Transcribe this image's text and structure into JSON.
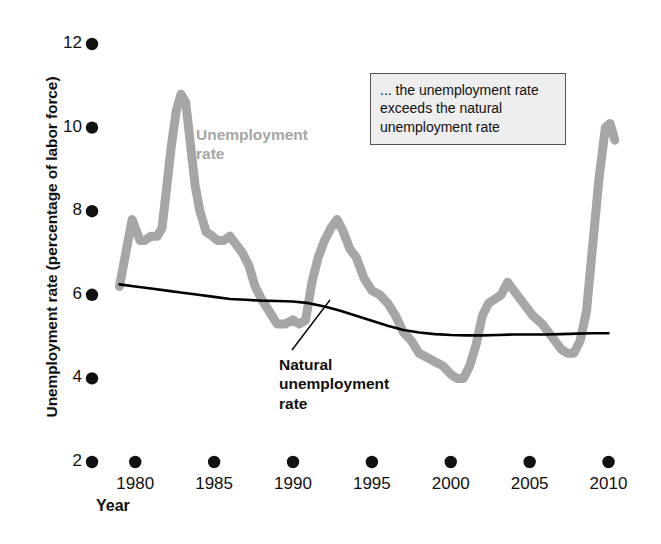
{
  "figure": {
    "background": "#ffffff",
    "series_gray_color": "#a6a6a6",
    "series_black_color": "#000000",
    "tick_dot_color": "#111111"
  },
  "axes": {
    "ylabel": "Unemployment rate (percentage of labor force)",
    "xlabel": "Year",
    "yticks": [
      2,
      4,
      6,
      8,
      10,
      12
    ],
    "ytick_labels": [
      "2",
      "4",
      "6",
      "8",
      "10",
      "12"
    ],
    "xticks": [
      1980,
      1985,
      1990,
      1995,
      2000,
      2005,
      2010
    ],
    "xtick_labels": [
      "1980",
      "1985",
      "1990",
      "1995",
      "2000",
      "2005",
      "2010"
    ],
    "ylim": [
      2,
      12
    ],
    "xlim": [
      1978.4,
      2010.6
    ],
    "grid": false
  },
  "annotations": {
    "callout": "... the unemployment rate exceeds the natural unemployment rate",
    "unemployment_label": "Unemployment rate",
    "natural_label": "Natural unemployment rate"
  },
  "chart_data": {
    "type": "line",
    "title": "",
    "xlabel": "Year",
    "ylabel": "Unemployment rate (percentage of labor force)",
    "ylim": [
      2,
      12
    ],
    "xlim": [
      1978.4,
      2010.6
    ],
    "grid": false,
    "legend_position": "inline-labels",
    "series": [
      {
        "name": "Unemployment rate",
        "color": "#a6a6a6",
        "x": [
          1979.0,
          1979.4,
          1979.8,
          1980.0,
          1980.3,
          1980.6,
          1981.0,
          1981.4,
          1981.7,
          1982.0,
          1982.3,
          1982.6,
          1982.9,
          1983.2,
          1983.5,
          1983.8,
          1984.1,
          1984.5,
          1984.9,
          1985.2,
          1985.6,
          1986.0,
          1986.4,
          1986.8,
          1987.2,
          1987.6,
          1988.0,
          1988.5,
          1989.0,
          1989.5,
          1990.0,
          1990.4,
          1990.8,
          1991.2,
          1991.6,
          1992.0,
          1992.4,
          1992.8,
          1993.2,
          1993.6,
          1994.0,
          1994.5,
          1995.0,
          1995.5,
          1996.0,
          1996.5,
          1997.0,
          1997.5,
          1998.0,
          1998.5,
          1999.0,
          1999.5,
          2000.0,
          2000.4,
          2000.8,
          2001.2,
          2001.6,
          2002.0,
          2002.4,
          2002.8,
          2003.2,
          2003.6,
          2004.0,
          2004.6,
          2005.2,
          2005.8,
          2006.4,
          2007.0,
          2007.4,
          2007.8,
          2008.2,
          2008.6,
          2009.0,
          2009.4,
          2009.8,
          2010.1,
          2010.4
        ],
        "y": [
          6.2,
          7.0,
          7.8,
          7.6,
          7.3,
          7.3,
          7.4,
          7.4,
          7.6,
          8.6,
          9.6,
          10.4,
          10.8,
          10.6,
          9.6,
          8.6,
          8.0,
          7.5,
          7.4,
          7.3,
          7.3,
          7.4,
          7.2,
          7.0,
          6.7,
          6.2,
          5.9,
          5.6,
          5.3,
          5.3,
          5.4,
          5.3,
          5.4,
          6.3,
          6.9,
          7.3,
          7.6,
          7.8,
          7.5,
          7.1,
          6.9,
          6.4,
          6.1,
          6.0,
          5.8,
          5.5,
          5.1,
          4.9,
          4.6,
          4.5,
          4.4,
          4.3,
          4.1,
          4.0,
          4.0,
          4.3,
          4.8,
          5.5,
          5.8,
          5.9,
          6.0,
          6.3,
          6.1,
          5.8,
          5.5,
          5.3,
          5.0,
          4.7,
          4.6,
          4.6,
          4.9,
          5.6,
          7.2,
          8.8,
          10.0,
          10.1,
          9.7
        ]
      },
      {
        "name": "Natural unemployment rate",
        "color": "#000000",
        "x": [
          1979.0,
          1980.0,
          1981.0,
          1982.0,
          1983.0,
          1984.0,
          1985.0,
          1986.0,
          1987.0,
          1988.0,
          1989.0,
          1990.0,
          1991.0,
          1992.0,
          1993.0,
          1994.0,
          1995.0,
          1996.0,
          1997.0,
          1998.0,
          1999.0,
          2000.0,
          2001.0,
          2002.0,
          2003.0,
          2004.0,
          2005.0,
          2006.0,
          2007.0,
          2008.0,
          2009.0,
          2010.0
        ],
        "y": [
          6.25,
          6.2,
          6.15,
          6.1,
          6.05,
          6.0,
          5.95,
          5.9,
          5.88,
          5.86,
          5.85,
          5.84,
          5.8,
          5.72,
          5.62,
          5.5,
          5.38,
          5.26,
          5.16,
          5.1,
          5.06,
          5.04,
          5.03,
          5.03,
          5.04,
          5.05,
          5.05,
          5.05,
          5.06,
          5.07,
          5.08,
          5.08
        ]
      }
    ],
    "annotations": [
      {
        "text": "... the unemployment rate exceeds the natural unemployment rate",
        "type": "callout-box"
      },
      {
        "text": "Unemployment rate",
        "type": "series-label"
      },
      {
        "text": "Natural unemployment rate",
        "type": "series-label-with-leader",
        "leader_to": {
          "x": 1995.0,
          "y": 5.38
        }
      }
    ]
  }
}
